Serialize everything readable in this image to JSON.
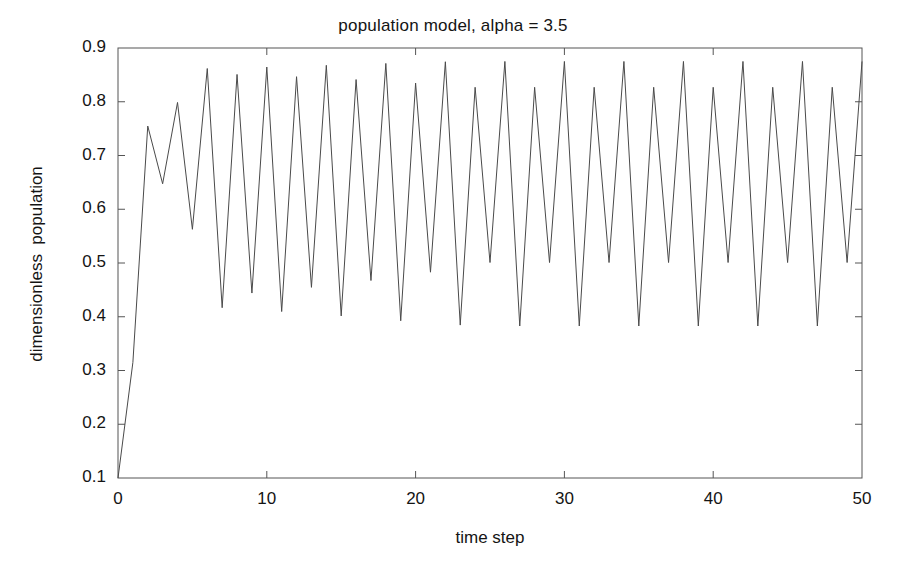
{
  "chart_data": {
    "type": "line",
    "title": "population model, alpha = 3.5",
    "xlabel": "time step",
    "ylabel": "dimensionless  population",
    "xlim": [
      0,
      50
    ],
    "ylim": [
      0.1,
      0.9
    ],
    "xticks": [
      0,
      10,
      20,
      30,
      40,
      50
    ],
    "xtick_labels": [
      "0",
      "10",
      "20",
      "30",
      "40",
      "50"
    ],
    "yticks": [
      0.1,
      0.2,
      0.3,
      0.4,
      0.5,
      0.6,
      0.7,
      0.8,
      0.9
    ],
    "ytick_labels": [
      "0.1",
      "0.2",
      "0.3",
      "0.4",
      "0.5",
      "0.6",
      "0.7",
      "0.8",
      "0.9"
    ],
    "grid": false,
    "legend": null,
    "line_color": "#4a4a4a",
    "line_width": 1,
    "series": [
      {
        "name": "population",
        "x": [
          0,
          1,
          2,
          3,
          4,
          5,
          6,
          7,
          8,
          9,
          10,
          11,
          12,
          13,
          14,
          15,
          16,
          17,
          18,
          19,
          20,
          21,
          22,
          23,
          24,
          25,
          26,
          27,
          28,
          29,
          30,
          31,
          32,
          33,
          34,
          35,
          36,
          37,
          38,
          39,
          40,
          41,
          42,
          43,
          44,
          45,
          46,
          47,
          48,
          49,
          50
        ],
        "values": [
          0.1,
          0.315,
          0.7548,
          0.6474,
          0.7987,
          0.5627,
          0.8618,
          0.4168,
          0.8508,
          0.4441,
          0.8646,
          0.4097,
          0.8466,
          0.4547,
          0.8678,
          0.4015,
          0.8413,
          0.4674,
          0.8713,
          0.3925,
          0.8347,
          0.4829,
          0.8744,
          0.3845,
          0.8269,
          0.5009,
          0.875,
          0.3828,
          0.8269,
          0.5009,
          0.875,
          0.3828,
          0.8269,
          0.5009,
          0.875,
          0.3828,
          0.8269,
          0.5009,
          0.875,
          0.3828,
          0.8269,
          0.5009,
          0.875,
          0.3828,
          0.8269,
          0.5009,
          0.875,
          0.3828,
          0.8269,
          0.5009,
          0.875
        ]
      }
    ]
  }
}
